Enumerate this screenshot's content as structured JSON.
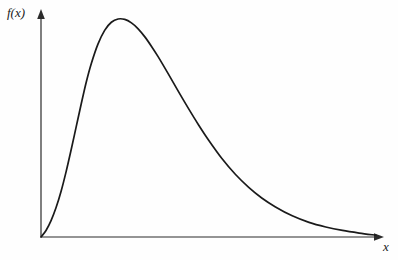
{
  "figure": {
    "background_color": "#fefefe",
    "ink_color": "#1a1a1a"
  },
  "axes": {
    "y_axis_label": "f(x)",
    "x_axis_label": "x",
    "origin_label": "",
    "y_axis_name": "y-axis",
    "x_axis_name": "x-axis"
  },
  "chart_data": {
    "type": "line",
    "title": "",
    "subtitle": "",
    "xlabel": "x",
    "ylabel": "f(x)",
    "legend": [],
    "legend_position": "none",
    "grid": false,
    "xticks": [],
    "yticks": [],
    "xticklabels": [],
    "yticklabels": [],
    "xlim": [
      0,
      1
    ],
    "ylim": [
      0,
      1
    ],
    "annotations": [],
    "series": [
      {
        "name": "density",
        "x": [
          0.0,
          0.015,
          0.03,
          0.045,
          0.06,
          0.075,
          0.09,
          0.105,
          0.12,
          0.135,
          0.15,
          0.17,
          0.19,
          0.21,
          0.23,
          0.25,
          0.27,
          0.29,
          0.31,
          0.33,
          0.35,
          0.38,
          0.41,
          0.44,
          0.47,
          0.5,
          0.54,
          0.58,
          0.62,
          0.66,
          0.7,
          0.75,
          0.8,
          0.85,
          0.9,
          0.95,
          1.0
        ],
        "y": [
          0.0,
          0.03,
          0.075,
          0.135,
          0.21,
          0.3,
          0.4,
          0.505,
          0.61,
          0.71,
          0.795,
          0.885,
          0.948,
          0.985,
          1.0,
          0.998,
          0.982,
          0.955,
          0.918,
          0.874,
          0.826,
          0.748,
          0.668,
          0.59,
          0.515,
          0.445,
          0.36,
          0.288,
          0.228,
          0.178,
          0.138,
          0.097,
          0.067,
          0.046,
          0.03,
          0.018,
          0.008
        ]
      }
    ]
  }
}
